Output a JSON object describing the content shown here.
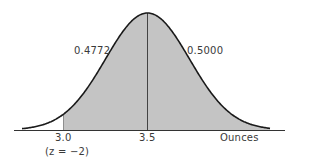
{
  "chart_data": {
    "type": "area",
    "title": "",
    "xlabel": "Ounces",
    "ylabel": "",
    "distribution": {
      "mean": 3.5,
      "sd": 0.25
    },
    "shaded_region": {
      "from": 3.0,
      "to": "infinity"
    },
    "x_ticks": [
      "3.0",
      "3.5"
    ],
    "annotations": [
      {
        "text": "0.4772",
        "region": "between 3.0 and 3.5"
      },
      {
        "text": "0.5000",
        "region": "above 3.5"
      },
      {
        "text": "(z = -2)",
        "position": "below 3.0"
      }
    ],
    "colors": {
      "shade": "#c4c4c4",
      "curve": "#1a1a1a",
      "axis": "#333333"
    }
  },
  "labels": {
    "left_area": "0.4772",
    "right_area": "0.5000",
    "tick_30": "3.0",
    "tick_35": "3.5",
    "z_note": "(z = −2)",
    "axis_unit": "Ounces"
  }
}
